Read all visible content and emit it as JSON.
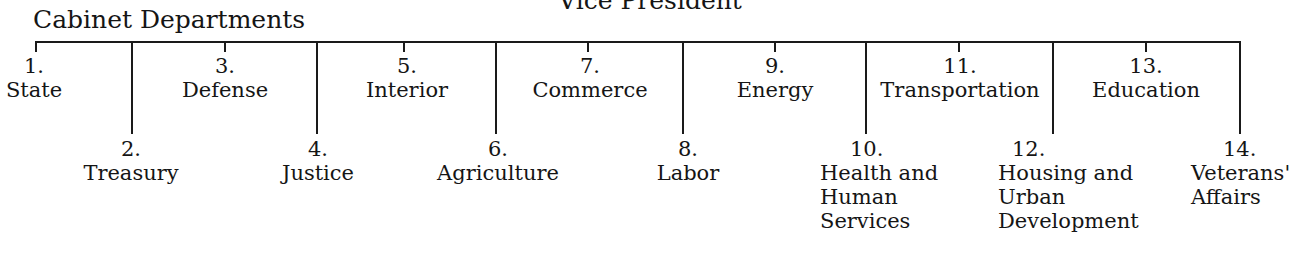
{
  "header": {
    "top_label": "Vice President",
    "title": "Cabinet Departments"
  },
  "departments": [
    {
      "num": "1.",
      "name": "State",
      "row": "top"
    },
    {
      "num": "2.",
      "name": "Treasury",
      "row": "bottom"
    },
    {
      "num": "3.",
      "name": "Defense",
      "row": "top"
    },
    {
      "num": "4.",
      "name": "Justice",
      "row": "bottom"
    },
    {
      "num": "5.",
      "name": "Interior",
      "row": "top"
    },
    {
      "num": "6.",
      "name": "Agriculture",
      "row": "bottom"
    },
    {
      "num": "7.",
      "name": "Commerce",
      "row": "top"
    },
    {
      "num": "8.",
      "name": "Labor",
      "row": "bottom"
    },
    {
      "num": "9.",
      "name": "Energy",
      "row": "top"
    },
    {
      "num": "10.",
      "name_lines": [
        "Health and",
        "Human",
        "Services"
      ],
      "row": "bottom"
    },
    {
      "num": "11.",
      "name": "Transportation",
      "row": "top"
    },
    {
      "num": "12.",
      "name_lines": [
        "Housing and",
        "Urban",
        "Development"
      ],
      "row": "bottom"
    },
    {
      "num": "13.",
      "name": "Education",
      "row": "top"
    },
    {
      "num": "14.",
      "name_lines": [
        "Veterans'",
        "Affairs"
      ],
      "row": "bottom"
    }
  ]
}
